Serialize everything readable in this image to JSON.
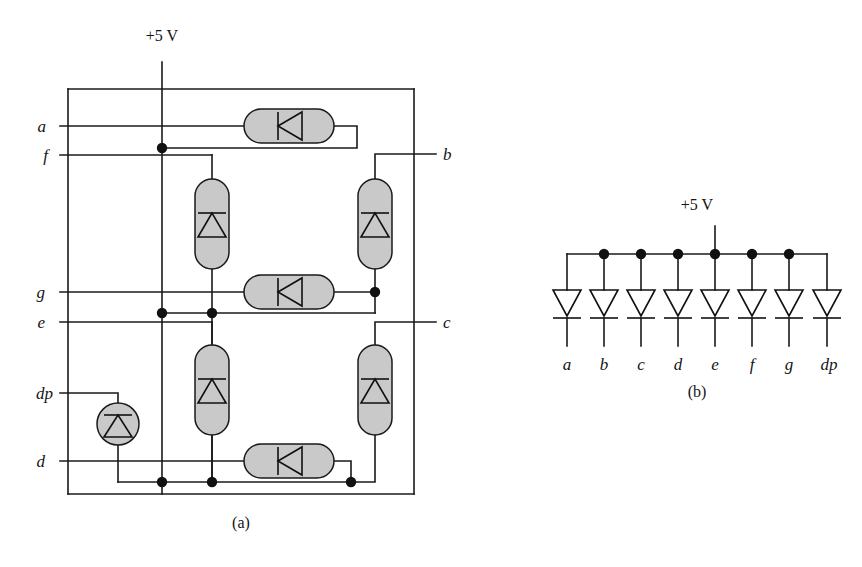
{
  "figure": {
    "background": "#ffffff",
    "ink_color": "#141414",
    "device_fill": "#c9c9c9",
    "panels": [
      {
        "id": "a",
        "caption": "(a)",
        "caption_x": 241,
        "caption_y": 528,
        "supply_label": "+5 V",
        "supply_label_x": 162,
        "supply_label_y": 41,
        "segment_labels": [
          {
            "text": "a",
            "x": 46,
            "y": 132
          },
          {
            "text": "f",
            "x": 48,
            "y": 161
          },
          {
            "text": "g",
            "x": 45,
            "y": 298
          },
          {
            "text": "e",
            "x": 45,
            "y": 328
          },
          {
            "text": "dp",
            "x": 31,
            "y": 399
          },
          {
            "text": "d",
            "x": 45,
            "y": 467
          },
          {
            "text": "b",
            "x": 443,
            "y": 160
          },
          {
            "text": "c",
            "x": 443,
            "y": 328
          }
        ],
        "devices": {
          "horizontal_diodes": [
            {
              "name": "diode-a",
              "cx": 289,
              "cy": 126
            },
            {
              "name": "diode-g",
              "cx": 289,
              "cy": 292
            },
            {
              "name": "diode-d",
              "cx": 289,
              "cy": 461
            }
          ],
          "vertical_diodes": [
            {
              "name": "diode-f",
              "cx": 212,
              "cy": 224
            },
            {
              "name": "diode-b",
              "cx": 375,
              "cy": 224
            },
            {
              "name": "diode-e",
              "cx": 212,
              "cy": 390
            },
            {
              "name": "diode-c",
              "cx": 375,
              "cy": 390
            }
          ],
          "led_circles": [
            {
              "name": "led-dp",
              "cx": 118,
              "cy": 424,
              "r": 21
            }
          ]
        },
        "junction_dots": [
          {
            "x": 162,
            "y": 148
          },
          {
            "x": 375,
            "y": 292
          },
          {
            "x": 162,
            "y": 313
          },
          {
            "x": 212,
            "y": 313
          },
          {
            "x": 162,
            "y": 482
          },
          {
            "x": 212,
            "y": 482
          },
          {
            "x": 351,
            "y": 482
          }
        ]
      },
      {
        "id": "b",
        "caption": "(b)",
        "caption_x": 697,
        "caption_y": 391,
        "supply_label": "+5 V",
        "supply_label_x": 697,
        "supply_label_y": 210,
        "rail_y": 254,
        "rail_x_start": 567,
        "rail_x_end": 827,
        "diode_y_top": 290,
        "diode_y_bottom": 322,
        "lead_bottom_y": 342,
        "label_y": 364,
        "columns": [
          {
            "label": "a",
            "x": 567,
            "dot": false
          },
          {
            "label": "b",
            "x": 604,
            "dot": true
          },
          {
            "label": "c",
            "x": 641,
            "dot": true
          },
          {
            "label": "d",
            "x": 678,
            "dot": true
          },
          {
            "label": "e",
            "x": 715,
            "dot": true
          },
          {
            "label": "f",
            "x": 752,
            "dot": true
          },
          {
            "label": "g",
            "x": 789,
            "dot": true
          },
          {
            "label": "dp",
            "x": 827,
            "dot": false
          }
        ]
      }
    ]
  }
}
